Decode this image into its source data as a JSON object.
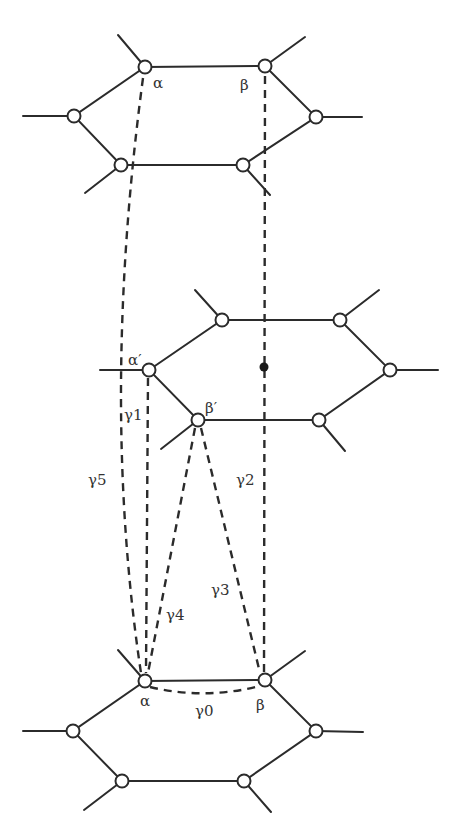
{
  "diagram": {
    "type": "lattice-hexagon-paths",
    "hexagons": [
      {
        "id": "top",
        "vertices": [
          [
            145,
            67
          ],
          [
            265,
            66
          ],
          [
            316,
            117
          ],
          [
            243,
            165
          ],
          [
            121,
            165
          ],
          [
            74,
            116
          ]
        ]
      },
      {
        "id": "middle",
        "vertices": [
          [
            149,
            370
          ],
          [
            222,
            320
          ],
          [
            340,
            320
          ],
          [
            390,
            370
          ],
          [
            319,
            420
          ],
          [
            198,
            420
          ]
        ],
        "center_dot": [
          264,
          367
        ]
      },
      {
        "id": "bottom",
        "vertices": [
          [
            145,
            681
          ],
          [
            265,
            680
          ],
          [
            316,
            731
          ],
          [
            244,
            781
          ],
          [
            122,
            781
          ],
          [
            73,
            731
          ]
        ]
      }
    ],
    "labels": {
      "alpha_top": "α",
      "beta_top": "β",
      "alpha_prime": "α′",
      "beta_prime": "β′",
      "alpha_bottom": "α",
      "beta_bottom": "β",
      "gamma0": "γ0",
      "gamma1": "γ1",
      "gamma2": "γ2",
      "gamma3": "γ3",
      "gamma4": "γ4",
      "gamma5": "γ5"
    },
    "paths": [
      {
        "name": "γ0",
        "from": "α (bottom)",
        "to": "β (bottom)",
        "style": "dashed"
      },
      {
        "name": "γ1",
        "from": "α′",
        "to": "α (bottom)",
        "style": "dashed"
      },
      {
        "name": "γ2",
        "from": "β (top)",
        "to": "β (bottom)",
        "style": "dashed",
        "through": "middle hexagon center"
      },
      {
        "name": "γ3",
        "from": "β′",
        "to": "β (bottom)",
        "style": "dashed"
      },
      {
        "name": "γ4",
        "from": "β′",
        "to": "α (bottom)",
        "style": "dashed"
      },
      {
        "name": "γ5",
        "from": "α (top)",
        "to": "α (bottom)",
        "style": "dashed"
      }
    ],
    "colors": {
      "line": "#2b2b2b",
      "node_fill": "#ffffff",
      "background": "#ffffff"
    }
  }
}
